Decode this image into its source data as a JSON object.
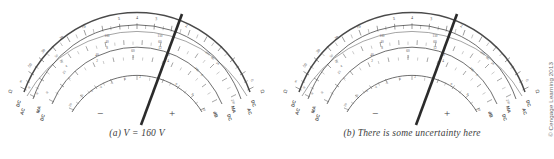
{
  "figure": {
    "copyright": "© Cengage Learning 2013",
    "meters": [
      {
        "id": "a",
        "caption": "(a) V = 160 V",
        "needle_value_label": "160",
        "scales": {
          "ohms": {
            "unit_left": "Ω",
            "unit_right": "Ω",
            "labels": [
              "∞",
              "50",
              "30",
              "20",
              "10",
              "5",
              "4",
              "3",
              "2",
              "1",
              "0"
            ]
          },
          "voltage": {
            "unit_left_top": "DC",
            "unit_left_bottom": "AC",
            "unit_right_top": "DC",
            "unit_right_bottom": "AC",
            "row1": [
              "0",
              "50",
              "100",
              "150",
              "200",
              "250"
            ],
            "row2": [
              "0",
              "20",
              "40",
              "60",
              "80",
              "100"
            ],
            "row3": [
              "0",
              "4",
              "8",
              "12",
              "16",
              "20"
            ]
          },
          "current": {
            "unit_left_top": "MA",
            "unit_left_bottom": "DC",
            "unit_right_top": "MA",
            "unit_right_bottom": "DC",
            "row1": [
              "0",
              "20",
              "40",
              "60",
              "80",
              "100"
            ],
            "row2": [
              "0",
              "1",
              "2",
              "3",
              "4",
              "5"
            ]
          },
          "decibel": {
            "unit": "dB",
            "labels": [
              "-20",
              "-10",
              "-6",
              "-4",
              "-2",
              "0",
              "2",
              "4",
              "6",
              "8",
              "10"
            ],
            "minus_sign": "−",
            "plus_sign": "+"
          }
        }
      },
      {
        "id": "b",
        "caption": "(b) There is some uncertainty here",
        "needle_value_label": "160",
        "scales": {
          "ohms": {
            "unit_left": "Ω",
            "unit_right": "Ω",
            "labels": [
              "∞",
              "50",
              "30",
              "20",
              "10",
              "5",
              "4",
              "3",
              "2",
              "1",
              "0"
            ]
          },
          "voltage": {
            "unit_left_top": "DC",
            "unit_left_bottom": "AC",
            "unit_right_top": "DC",
            "unit_right_bottom": "AC",
            "row1": [
              "0",
              "50",
              "100",
              "150",
              "200",
              "250"
            ],
            "row2": [
              "0",
              "20",
              "40",
              "60",
              "80",
              "100"
            ],
            "row3": [
              "0",
              "4",
              "8",
              "12",
              "16",
              "20"
            ]
          },
          "current": {
            "unit_left_top": "MA",
            "unit_left_bottom": "DC",
            "unit_right_top": "MA",
            "unit_right_bottom": "DC",
            "row1": [
              "0",
              "20",
              "40",
              "60",
              "80",
              "100"
            ],
            "row2": [
              "0",
              "1",
              "2",
              "3",
              "4",
              "5"
            ]
          },
          "decibel": {
            "unit": "dB",
            "labels": [
              "-20",
              "-10",
              "-6",
              "-4",
              "-2",
              "0",
              "2",
              "4",
              "6",
              "8",
              "10"
            ],
            "minus_sign": "−",
            "plus_sign": "+"
          }
        }
      }
    ]
  },
  "colors": {
    "background": "#ffffff",
    "ink": "#4a4a4a",
    "needle": "#2b2b2b",
    "caption": "#3c3c3c"
  }
}
